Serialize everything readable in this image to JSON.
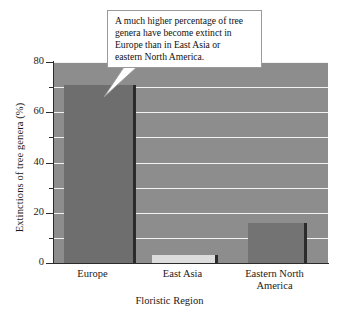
{
  "chart_data": {
    "type": "bar",
    "title": "",
    "categories": [
      "Europe",
      "East Asia",
      "Eastern North America"
    ],
    "values": [
      71,
      3,
      16
    ],
    "xlabel": "Floristic Region",
    "ylabel": "Extinctions of tree genera (%)",
    "ylim": [
      0,
      80
    ],
    "ytick_labels": [
      "0",
      "20",
      "40",
      "60",
      "80"
    ],
    "ytick_values": [
      0,
      20,
      40,
      60,
      80
    ],
    "minor_ytick_values": [
      10,
      30,
      50,
      70
    ],
    "gridlines": [
      10,
      20,
      30,
      40,
      50,
      60,
      70,
      80
    ],
    "grid": true,
    "legend": "none",
    "annotations": [
      {
        "text": "A much higher percentage of tree genera have become extinct in Europe than in East Asia or eastern North America.",
        "points_to": "Europe"
      }
    ],
    "colors": {
      "plot_background": "#8d8d8d",
      "gridline": "#f2f2f2",
      "bar_europe": "#6e6e6e",
      "bar_east_asia": "#dcdcdc",
      "bar_eastern_north_america": "#737373",
      "bar_edge": "#2b2b2b",
      "axis": "#2b2b2b",
      "text": "#1a1a1a",
      "callout_background": "#ffffff",
      "callout_border": "#9a9a9a"
    }
  },
  "axis": {
    "y_title": "Extinctions of tree genera (%)",
    "x_title": "Floristic Region",
    "ticks": [
      {
        "label": "80"
      },
      {
        "label": "60"
      },
      {
        "label": "40"
      },
      {
        "label": "20"
      },
      {
        "label": "0"
      }
    ]
  },
  "categories": [
    {
      "label": "Europe",
      "label_line2": ""
    },
    {
      "label": "East Asia",
      "label_line2": ""
    },
    {
      "label": "Eastern North",
      "label_line2": "America"
    }
  ],
  "callout": {
    "line1": "A much higher percentage of tree",
    "line2": "genera have become extinct in",
    "line3": "Europe than in East Asia or",
    "line4": "eastern North America."
  }
}
